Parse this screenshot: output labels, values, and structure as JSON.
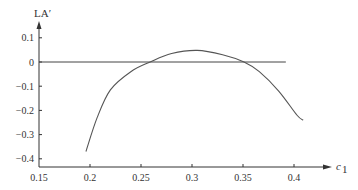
{
  "chart_data": {
    "type": "line",
    "title": "",
    "xlabel": "c",
    "xlabel_subscript": "1",
    "ylabel": "LA′",
    "xlim": [
      0.15,
      0.42
    ],
    "ylim": [
      -0.43,
      0.13
    ],
    "grid": false,
    "legend": null,
    "x_ticks": [
      0.15,
      0.2,
      0.25,
      0.3,
      0.35,
      0.4
    ],
    "x_tick_labels": [
      "0.15",
      "0.2",
      "0.25",
      "0.3",
      "0.35",
      "0.4"
    ],
    "y_ticks": [
      0.1,
      0,
      -0.1,
      -0.2,
      -0.3,
      -0.4
    ],
    "y_tick_labels": [
      "0.1",
      "0",
      "−0.1",
      "−0.2",
      "−0.3",
      "−0.4"
    ],
    "series": [
      {
        "name": "LA′ curve",
        "x": [
          0.196,
          0.207,
          0.22,
          0.24,
          0.259,
          0.28,
          0.305,
          0.33,
          0.351,
          0.366,
          0.385,
          0.403,
          0.409
        ],
        "y": [
          -0.37,
          -0.23,
          -0.115,
          -0.04,
          0.0,
          0.035,
          0.048,
          0.03,
          0.0,
          -0.04,
          -0.12,
          -0.22,
          -0.24
        ]
      },
      {
        "name": "zero reference",
        "x": [
          0.15,
          0.392
        ],
        "y": [
          0,
          0
        ]
      }
    ],
    "annotations": {
      "zero_crossings": [
        0.259,
        0.351
      ],
      "peak": {
        "x": 0.305,
        "y": 0.048
      }
    }
  },
  "colors": {
    "axis": "#333333",
    "curve": "#555555",
    "reference_line": "#444444"
  }
}
